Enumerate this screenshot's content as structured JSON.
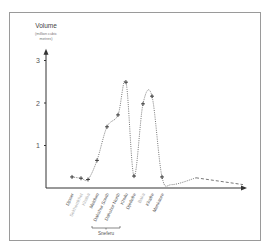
{
  "chart_data": {
    "type": "line",
    "title": "",
    "ylabel": "Volume",
    "ylabel_sub": [
      "(million cubic",
      "metres)"
    ],
    "xlabel": "",
    "ylim": [
      0,
      3.3
    ],
    "yticks": [
      1,
      2,
      3
    ],
    "grid": false,
    "categories": [
      "Djoser",
      "Sekhemkhet",
      "Khaba",
      "Meidum",
      "Dahshur South",
      "Dahshur North",
      "Khufu",
      "Djedefre",
      "Baka",
      "Khafre",
      "Menkaure"
    ],
    "category_muted": [
      false,
      true,
      true,
      false,
      false,
      false,
      false,
      false,
      true,
      false,
      false
    ],
    "values": [
      0.26,
      0.23,
      0.2,
      0.65,
      1.44,
      1.72,
      2.49,
      0.28,
      1.98,
      2.16,
      0.26
    ],
    "tail_values": [
      0.08,
      0.24,
      0.08
    ],
    "group_bracket": {
      "label": "Sneferu",
      "from": "Meidum",
      "to": "Dahshur North"
    },
    "line_style": "dotted",
    "colors": {
      "line": "#555555",
      "axis": "#333333",
      "label": "#555555",
      "label_muted": "#b0b0b0"
    }
  }
}
